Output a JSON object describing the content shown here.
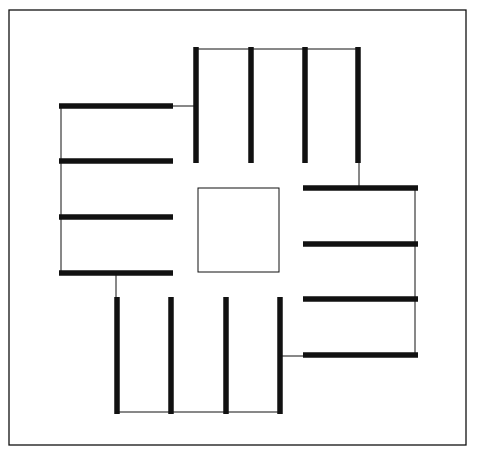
{
  "diagram": {
    "colors": {
      "stroke": "#111111",
      "background": "#ffffff"
    },
    "frame": {
      "x": 9,
      "y": 10,
      "w": 457,
      "h": 435
    },
    "center_square": {
      "x": 198,
      "y": 188,
      "w": 81,
      "h": 84
    },
    "groups": [
      {
        "name": "top",
        "bars": [
          [
            196,
            47,
            196,
            163
          ],
          [
            251,
            47,
            251,
            163
          ],
          [
            305,
            47,
            305,
            163
          ],
          [
            358,
            47,
            358,
            163
          ]
        ],
        "connector": [
          196,
          49,
          358,
          49
        ]
      },
      {
        "name": "left",
        "bars": [
          [
            59,
            106,
            173,
            106
          ],
          [
            59,
            161,
            173,
            161
          ],
          [
            59,
            217,
            173,
            217
          ],
          [
            59,
            273,
            173,
            273
          ]
        ],
        "connector": [
          61,
          106,
          61,
          273
        ]
      },
      {
        "name": "bottom",
        "bars": [
          [
            117,
            297,
            117,
            414
          ],
          [
            171,
            297,
            171,
            414
          ],
          [
            226,
            297,
            226,
            414
          ],
          [
            280,
            297,
            280,
            414
          ]
        ],
        "connector": [
          117,
          412,
          280,
          412
        ]
      },
      {
        "name": "right",
        "bars": [
          [
            303,
            188,
            418,
            188
          ],
          [
            303,
            244,
            418,
            244
          ],
          [
            303,
            299,
            418,
            299
          ],
          [
            303,
            355,
            418,
            355
          ]
        ],
        "connector": [
          415,
          188,
          415,
          355
        ]
      }
    ],
    "links": [
      [
        173,
        106,
        196,
        106
      ],
      [
        359,
        163,
        359,
        188
      ],
      [
        116,
        273,
        116,
        297
      ],
      [
        280,
        356,
        303,
        356
      ]
    ]
  }
}
